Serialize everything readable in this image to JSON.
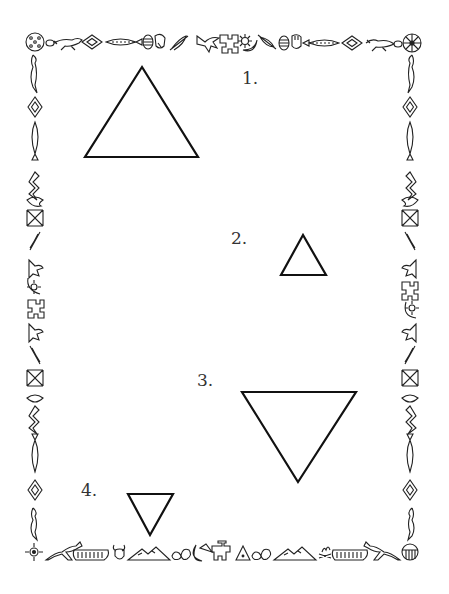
{
  "worksheet": {
    "items": [
      {
        "label": "1.",
        "shape": "triangle",
        "orientation": "up",
        "size": "large"
      },
      {
        "label": "2.",
        "shape": "triangle",
        "orientation": "up",
        "size": "small"
      },
      {
        "label": "3.",
        "shape": "triangle",
        "orientation": "down",
        "size": "large"
      },
      {
        "label": "4.",
        "shape": "triangle",
        "orientation": "down",
        "size": "small"
      }
    ]
  },
  "border": {
    "style": "native-american-pictograph-frame",
    "stroke_color": "#222222",
    "top_icons": [
      "shield-dots",
      "beaded-ornament",
      "lizard",
      "diamond",
      "feather-fish",
      "egg-striped",
      "hand",
      "feather",
      "bird",
      "thunderbird",
      "sun-moon",
      "feather",
      "egg-striped",
      "hand",
      "feather-fish",
      "diamond",
      "lizard",
      "beaded-ornament",
      "medicine-wheel"
    ],
    "side_icons": [
      "lizard",
      "diamond",
      "feather-fish",
      "snake",
      "fish",
      "hourglass-pattern",
      "feather",
      "bird",
      "sun-moon",
      "thunderbird"
    ],
    "bottom_icons": [
      "sun-symbol",
      "running-horse",
      "canoe",
      "buffalo-head",
      "mountains",
      "rocks",
      "moon-tepee",
      "thunderbird",
      "tepee",
      "rocks",
      "mountains",
      "campfire",
      "canoe",
      "running-horse",
      "shield-striped"
    ]
  },
  "colors": {
    "background": "#ffffff",
    "line": "#111111",
    "label": "#333333"
  }
}
